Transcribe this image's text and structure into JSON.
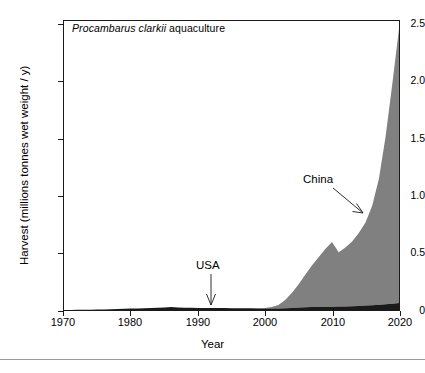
{
  "figure": {
    "title_italic": "Procambarus clarkii",
    "title_rest": " aquaculture",
    "xlabel": "Year",
    "ylabel": "Harvest (millions tonnes wet weight / y)"
  },
  "annotations": {
    "china": "China",
    "usa": "USA"
  },
  "axes": {
    "ytick_labels": [
      "2.5",
      "2.0",
      "1.5",
      "1.0",
      "0.5",
      "0"
    ],
    "xtick_labels": [
      "1970",
      "1980",
      "1990",
      "2000",
      "2010",
      "2020"
    ]
  },
  "colors": {
    "usa_fill": "#1a1a1a",
    "china_fill": "#808080",
    "frame": "#1a1a1a",
    "background": "#ffffff",
    "rule": "#9a9a9a"
  },
  "chart_data": {
    "type": "area",
    "stacked": true,
    "title": "Procambarus clarkii aquaculture",
    "xlabel": "Year",
    "ylabel": "Harvest (millions tonnes wet weight / y)",
    "xlim": [
      1970,
      2020
    ],
    "ylim": [
      0,
      2.5
    ],
    "xticks": [
      1970,
      1980,
      1990,
      2000,
      2010,
      2020
    ],
    "yticks": [
      0,
      0.5,
      1.0,
      1.5,
      2.0,
      2.5
    ],
    "grid": false,
    "legend": "none (direct labels with arrows)",
    "annotations": [
      {
        "text": "China",
        "points_to_year": 2016,
        "points_to_value": 0.95
      },
      {
        "text": "USA",
        "points_to_year": 1993,
        "points_to_value": 0.02
      }
    ],
    "x": [
      1970,
      1971,
      1972,
      1973,
      1974,
      1975,
      1976,
      1977,
      1978,
      1979,
      1980,
      1981,
      1982,
      1983,
      1984,
      1985,
      1986,
      1987,
      1988,
      1989,
      1990,
      1991,
      1992,
      1993,
      1994,
      1995,
      1996,
      1997,
      1998,
      1999,
      2000,
      2001,
      2002,
      2003,
      2004,
      2005,
      2006,
      2007,
      2008,
      2009,
      2010,
      2011,
      2012,
      2013,
      2014,
      2015,
      2016,
      2017,
      2018,
      2019,
      2020
    ],
    "series": [
      {
        "name": "USA",
        "color": "#1a1a1a",
        "values": [
          0.001,
          0.001,
          0.002,
          0.002,
          0.003,
          0.004,
          0.005,
          0.006,
          0.008,
          0.01,
          0.012,
          0.014,
          0.016,
          0.018,
          0.02,
          0.021,
          0.026,
          0.022,
          0.02,
          0.019,
          0.018,
          0.018,
          0.017,
          0.017,
          0.017,
          0.016,
          0.016,
          0.015,
          0.015,
          0.014,
          0.013,
          0.013,
          0.014,
          0.016,
          0.018,
          0.021,
          0.024,
          0.026,
          0.027,
          0.028,
          0.029,
          0.03,
          0.031,
          0.033,
          0.035,
          0.038,
          0.041,
          0.045,
          0.05,
          0.055,
          0.06
        ]
      },
      {
        "name": "China",
        "color": "#808080",
        "values": [
          0.0,
          0.0,
          0.0,
          0.0,
          0.0,
          0.0,
          0.0,
          0.0,
          0.0,
          0.0,
          0.0,
          0.0,
          0.0,
          0.0,
          0.0,
          0.0,
          0.0,
          0.0,
          0.0,
          0.0,
          0.0,
          0.0,
          0.0,
          0.0,
          0.0,
          0.0,
          0.0,
          0.0,
          0.001,
          0.002,
          0.004,
          0.012,
          0.03,
          0.07,
          0.13,
          0.2,
          0.28,
          0.36,
          0.43,
          0.5,
          0.56,
          0.47,
          0.51,
          0.56,
          0.63,
          0.72,
          0.86,
          1.09,
          1.45,
          1.9,
          2.37
        ]
      }
    ],
    "total_2020": 2.43
  }
}
